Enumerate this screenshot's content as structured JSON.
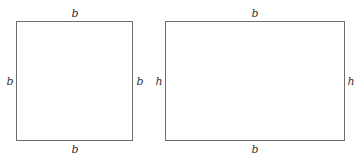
{
  "square": {
    "top_label": "b",
    "bottom_label": "b",
    "left_label": "b",
    "right_label": "b"
  },
  "rectangle": {
    "top_label": "b",
    "bottom_label": "b",
    "left_label": "h",
    "right_label": "h"
  },
  "colors": {
    "stroke": "#6e6e6e",
    "text": "#333333",
    "background": "#ffffff"
  }
}
